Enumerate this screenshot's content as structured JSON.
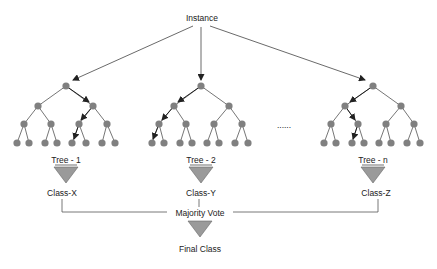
{
  "diagram": {
    "colors": {
      "node": "#808080",
      "edge": "#555555",
      "triangle": "#9a9a9a",
      "connector": "#555555"
    },
    "root_label": "Instance",
    "ellipsis": "......",
    "trees": [
      {
        "label": "Tree - 1",
        "class": "Class-X"
      },
      {
        "label": "Tree - 2",
        "class": "Class-Y"
      },
      {
        "label": "Tree - n",
        "class": "Class-Z"
      }
    ],
    "vote_label": "Majority Vote",
    "final_label": "Final Class"
  }
}
